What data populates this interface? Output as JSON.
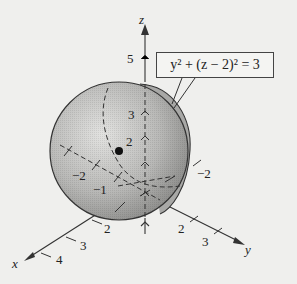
{
  "figure": {
    "equation": "y² + (z − 2)² = 3",
    "center_label": "2",
    "axes": {
      "x": {
        "label": "x",
        "ticks": [
          "2",
          "3",
          "4"
        ],
        "neg_ticks": [
          "−1",
          "−2"
        ]
      },
      "y": {
        "label": "y",
        "ticks": [
          "2",
          "3"
        ],
        "neg_ticks": [
          "−2"
        ]
      },
      "z": {
        "label": "z",
        "ticks": [
          "5",
          "3",
          "2"
        ]
      }
    },
    "colors": {
      "background": "#efefed",
      "sphere_light": "#d8d8d6",
      "sphere_dark": "#8e8e8c",
      "stroke": "#333333"
    }
  }
}
